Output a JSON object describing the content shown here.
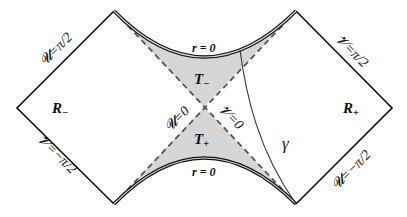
{
  "diagram": {
    "colors": {
      "background": "#ffffff",
      "line": "#111111",
      "shade": "#d6d6d6",
      "dash": "#555555"
    },
    "regions": {
      "r_minus": "R",
      "r_minus_sub": "−",
      "r_plus": "R",
      "r_plus_sub": "+",
      "t_minus": "T",
      "t_minus_sub": "−",
      "t_plus": "T",
      "t_plus_sub": "+"
    },
    "singularities": {
      "top": "r = 0",
      "bottom": "r = 0"
    },
    "boundary_labels": {
      "top_left": "𝓤=π/2",
      "top_right": "𝓥=π/2",
      "bottom_left": "𝓥=−π/2",
      "bottom_right": "𝓤=−π/2"
    },
    "horizon_labels": {
      "u_zero": "𝓤=0",
      "v_zero": "𝓥=0"
    },
    "curve_label": "γ"
  }
}
